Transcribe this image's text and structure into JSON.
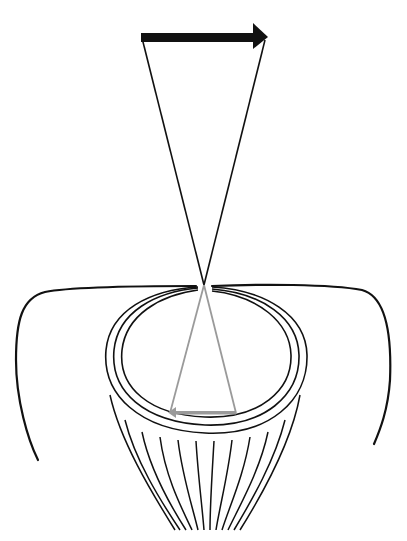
{
  "diagram": {
    "type": "eye-image-formation",
    "colors": {
      "background": "#ffffff",
      "ink": "#111111",
      "image_ray": "#9a9a9a"
    },
    "object_arrow": {
      "direction": "right",
      "x1": 141,
      "x2": 267,
      "y": 37
    },
    "focal_point": {
      "x": 204,
      "y": 285
    },
    "image_arrow": {
      "direction": "left",
      "x1": 170,
      "x2": 236,
      "y": 413
    }
  }
}
